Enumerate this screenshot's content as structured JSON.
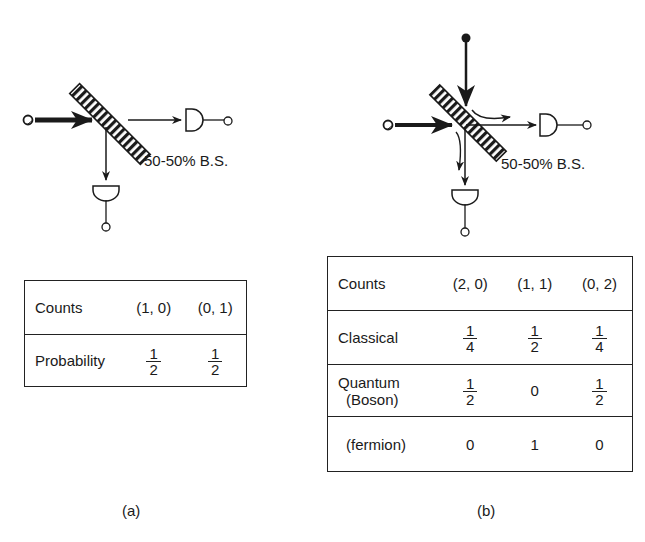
{
  "panel_a": {
    "beam_splitter_label": "50-50% B.S.",
    "table": {
      "header": {
        "label": "Counts",
        "cols": [
          "(1, 0)",
          "(0, 1)"
        ]
      },
      "rows": [
        {
          "label": "Probability",
          "values": [
            {
              "num": "1",
              "den": "2"
            },
            {
              "num": "1",
              "den": "2"
            }
          ]
        }
      ]
    },
    "caption": "(a)"
  },
  "panel_b": {
    "beam_splitter_label": "50-50% B.S.",
    "table": {
      "header": {
        "label": "Counts",
        "cols": [
          "(2, 0)",
          "(1, 1)",
          "(0, 2)"
        ]
      },
      "rows": [
        {
          "label": "Classical",
          "values": [
            {
              "num": "1",
              "den": "4"
            },
            {
              "num": "1",
              "den": "2"
            },
            {
              "num": "1",
              "den": "4"
            }
          ]
        },
        {
          "label_line1": "Quantum",
          "label_line2": "(Boson)",
          "values": [
            {
              "num": "1",
              "den": "2"
            },
            "0",
            {
              "num": "1",
              "den": "2"
            }
          ]
        },
        {
          "label": "(fermion)",
          "values": [
            "0",
            "1",
            "0"
          ]
        }
      ]
    },
    "caption": "(b)"
  },
  "colors": {
    "ink": "#1a1a1a",
    "background": "#ffffff"
  }
}
